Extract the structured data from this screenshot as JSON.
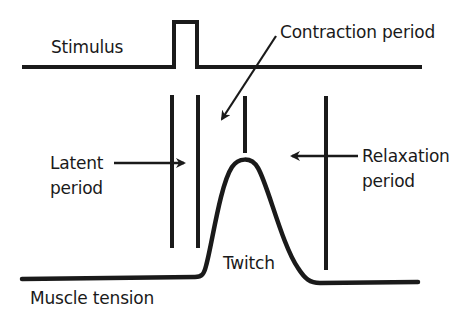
{
  "diagram": {
    "labels": {
      "stimulus": "Stimulus",
      "contraction": "Contraction period",
      "latent_line1": "Latent",
      "latent_line2": "period",
      "relaxation_line1": "Relaxation",
      "relaxation_line2": "period",
      "twitch": "Twitch",
      "muscle_tension": "Muscle tension"
    },
    "colors": {
      "stroke": "#1a1a1a",
      "background": "#ffffff"
    },
    "traces": [
      {
        "name": "Stimulus",
        "description": "flat baseline with a single square pulse"
      },
      {
        "name": "Muscle tension",
        "description": "flat baseline, bell-shaped twitch after latent period, return to baseline"
      }
    ],
    "periods": [
      "Latent period",
      "Contraction period",
      "Relaxation period"
    ]
  }
}
